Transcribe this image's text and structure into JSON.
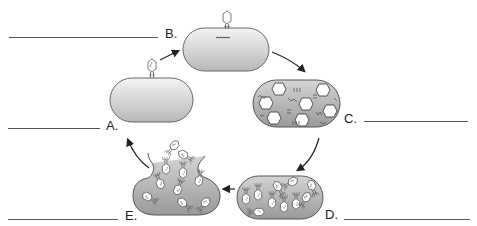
{
  "diagram": {
    "labels": {
      "A": "A.",
      "B": "B.",
      "C": "C.",
      "D": "D.",
      "E": "E."
    },
    "stages": [
      {
        "id": "A",
        "description": "Phage attaches to bacterial cell"
      },
      {
        "id": "B",
        "description": "Phage injects DNA into bacterium"
      },
      {
        "id": "C",
        "description": "Phage heads, tails and DNA synthesized in cell"
      },
      {
        "id": "D",
        "description": "New phages assembled inside cell"
      },
      {
        "id": "E",
        "description": "Cell lyses, releasing new phages"
      }
    ],
    "flow": [
      "A",
      "B",
      "C",
      "D",
      "E",
      "A"
    ],
    "answer_blanks": [
      "A",
      "B",
      "C",
      "D",
      "E"
    ],
    "colors": {
      "cell_fill_light": "#e8e8e8",
      "cell_fill_dark": "#9a9a9a",
      "outline": "#555555",
      "arrow": "#222222",
      "capsid_fill": "#ffffff"
    }
  }
}
